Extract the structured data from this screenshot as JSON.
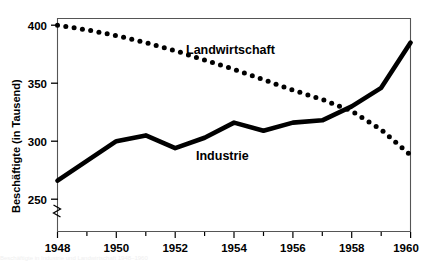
{
  "chart_data": {
    "type": "line",
    "title": "",
    "subtitle": "",
    "xlabel": "",
    "ylabel": "Beschäftigte (in Tausend)",
    "x": [
      1948,
      1949,
      1950,
      1951,
      1952,
      1953,
      1954,
      1955,
      1956,
      1957,
      1958,
      1959,
      1960
    ],
    "xlim": [
      1948,
      1960
    ],
    "ylim": [
      250,
      405
    ],
    "y_axis_break": true,
    "y_axis_break_symbol": "zigzag",
    "grid": false,
    "legend": "inline-labels",
    "xticks": [
      1948,
      1950,
      1952,
      1954,
      1956,
      1958,
      1960
    ],
    "xticklabels": [
      "1948",
      "1950",
      "1952",
      "1954",
      "1956",
      "1958",
      "1960"
    ],
    "xminorticks": [
      1949,
      1951,
      1953,
      1955,
      1957,
      1959
    ],
    "yticks": [
      250,
      300,
      350,
      400
    ],
    "yticklabels": [
      "250",
      "300",
      "350",
      "400"
    ],
    "series": [
      {
        "name": "Landwirtschaft",
        "style": "dotted",
        "color": "#000000",
        "label_x": 1954.1,
        "label_y": 378,
        "values": [
          400,
          396,
          391,
          385,
          378,
          370,
          362,
          353,
          344,
          336,
          326,
          310,
          288
        ]
      },
      {
        "name": "Industrie",
        "style": "solid",
        "color": "#000000",
        "label_x": 1954.2,
        "label_y": 292,
        "values": [
          266,
          283,
          300,
          305,
          294,
          303,
          316,
          309,
          316,
          318,
          330,
          346,
          385
        ]
      }
    ]
  },
  "caption": {
    "text": "Beschäftigte in Industrie und Landwirtschaft 1948–1960"
  }
}
